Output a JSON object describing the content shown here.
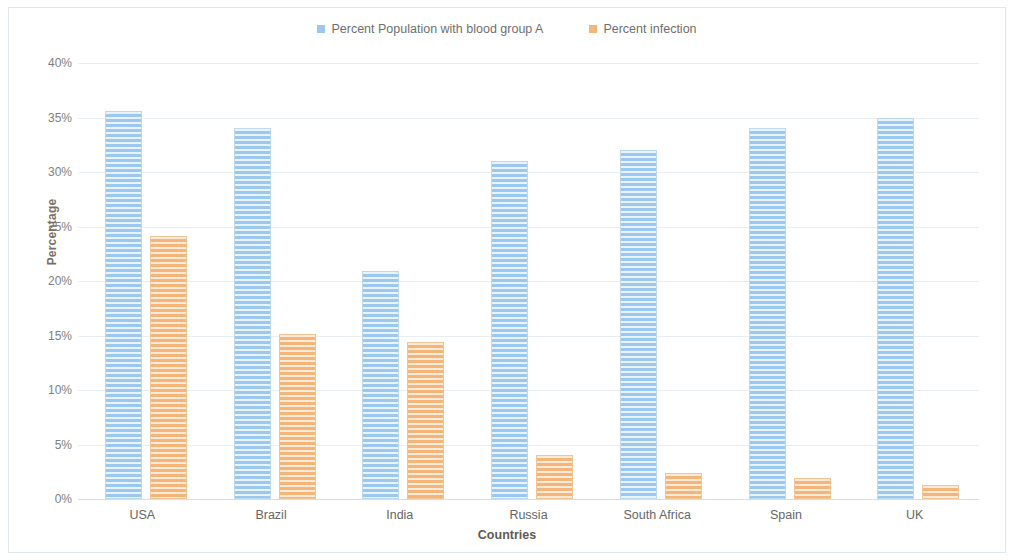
{
  "chart_data": {
    "type": "bar",
    "title": "",
    "xlabel": "Countries",
    "ylabel": "Percentage",
    "categories": [
      "USA",
      "Brazil",
      "India",
      "Russia",
      "South Africa",
      "Spain",
      "UK"
    ],
    "series": [
      {
        "name": "Percent Population with blood group A",
        "color": "#9dc8ee",
        "values": [
          35.6,
          34.0,
          20.9,
          31.0,
          32.0,
          34.0,
          35.0
        ]
      },
      {
        "name": "Percent infection",
        "color": "#f4b678",
        "values": [
          24.1,
          15.1,
          14.4,
          4.0,
          2.4,
          1.9,
          1.3
        ]
      }
    ],
    "ylim": [
      0,
      40
    ],
    "ytick_labels": [
      "0%",
      "5%",
      "10%",
      "15%",
      "20%",
      "25%",
      "30%",
      "35%",
      "40%"
    ],
    "ytick_values": [
      0,
      5,
      10,
      15,
      20,
      25,
      30,
      35,
      40
    ],
    "grid": true,
    "legend_position": "top-center"
  }
}
